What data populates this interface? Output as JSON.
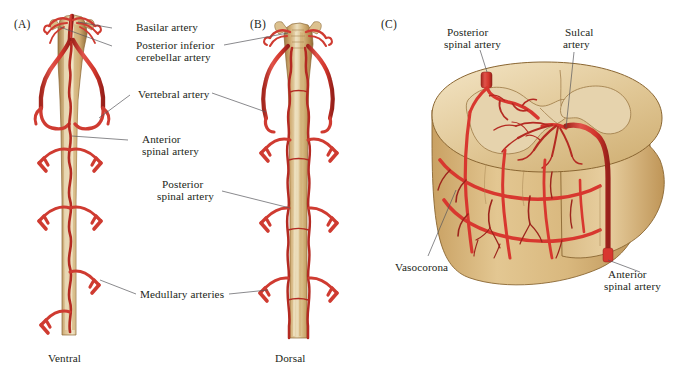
{
  "figure": {
    "background_color": "#ffffff"
  },
  "colors": {
    "artery_red": "#d8372f",
    "artery_dark": "#8f2018",
    "artery_light": "#e8655c",
    "cord_tan": "#c9a266",
    "cord_light": "#e3cda2",
    "cord_dark": "#9a7540",
    "gray_matter": "#e8d7b4",
    "white_matter": "#cdae78",
    "outline": "#6b4f28",
    "leader_line": "#58585b",
    "text": "#231f20"
  },
  "panels": [
    {
      "id": "A",
      "letter": "(A)",
      "caption": "Ventral"
    },
    {
      "id": "B",
      "letter": "(B)",
      "caption": "Dorsal"
    },
    {
      "id": "C",
      "letter": "(C)",
      "caption": ""
    }
  ],
  "labels": {
    "basilar_artery": "Basilar artery",
    "pica_line1": "Posterior inferior",
    "pica_line2": "cerebellar artery",
    "vertebral_artery": "Vertebral artery",
    "anterior_spinal_line1": "Anterior",
    "anterior_spinal_line2": "spinal artery",
    "posterior_spinal_line1": "Posterior",
    "posterior_spinal_line2": "spinal artery",
    "medullary_arteries": "Medullary arteries",
    "c_posterior_spinal_line1": "Posterior",
    "c_posterior_spinal_line2": "spinal artery",
    "c_sulcal_line1": "Sulcal",
    "c_sulcal_line2": "artery",
    "c_vasocorona": "Vasocorona",
    "c_anterior_spinal_line1": "Anterior",
    "c_anterior_spinal_line2": "spinal artery"
  },
  "captions": {
    "ventral": "Ventral",
    "dorsal": "Dorsal"
  }
}
